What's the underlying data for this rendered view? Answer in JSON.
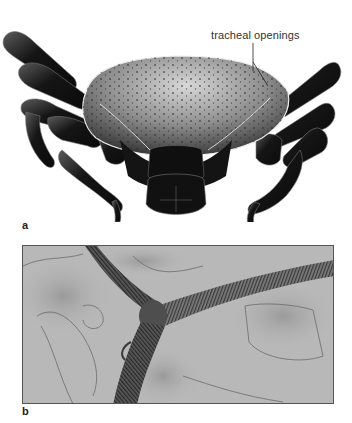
{
  "figure": {
    "panels": [
      {
        "label": "a",
        "description": "scanning electron micrograph of a tick, dorsal view",
        "annotations": [
          {
            "text": "tracheal openings"
          }
        ]
      },
      {
        "label": "b",
        "description": "light micrograph of branching tracheae with spiral rings"
      }
    ],
    "colors": {
      "background": "#ffffff",
      "specimen_dark": "#111111",
      "shield_gray": "#8a8a8a",
      "micrograph_bg": "#b9b9b9",
      "trachea": "#4a4a4a"
    }
  }
}
